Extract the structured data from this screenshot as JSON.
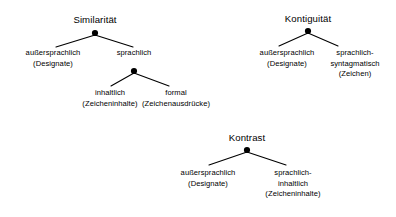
{
  "diagram": {
    "type": "tree-diagram",
    "background_color": "#ffffff",
    "text_color": "#000000",
    "line_color": "#000000",
    "trees": [
      {
        "id": "similaritaet",
        "root": {
          "label": "Similarität",
          "dot": true,
          "x": 95,
          "y": 33,
          "label_y": 14
        },
        "nodes": [
          {
            "id": "sim-aussersprachlich",
            "lines": [
              "außersprachlich",
              "(Designate)"
            ],
            "dot": false,
            "x": 53,
            "y": 48,
            "label_y": 48
          },
          {
            "id": "sim-sprachlich",
            "lines": [
              "sprachlich"
            ],
            "dot": true,
            "x": 134,
            "y": 71,
            "label_y": 48
          },
          {
            "id": "sim-inhaltlich",
            "lines": [
              "inhaltlich",
              "(Zeicheninhalte)"
            ],
            "dot": false,
            "x": 110,
            "y": 88,
            "label_y": 88
          },
          {
            "id": "sim-formal",
            "lines": [
              "formal",
              "(Zeichenausdrücke)"
            ],
            "dot": false,
            "x": 175,
            "y": 88,
            "label_y": 88
          }
        ],
        "edges": [
          {
            "from": "similaritaet-root",
            "x1": 95,
            "y1": 35,
            "x2": 56,
            "y2": 47
          },
          {
            "from": "similaritaet-root",
            "x1": 95,
            "y1": 35,
            "x2": 133,
            "y2": 47
          },
          {
            "from": "sim-sprachlich",
            "x1": 134,
            "y1": 73,
            "x2": 111,
            "y2": 86
          },
          {
            "from": "sim-sprachlich",
            "x1": 134,
            "y1": 73,
            "x2": 169,
            "y2": 86
          }
        ]
      },
      {
        "id": "kontiguitaet",
        "root": {
          "label": "Kontiguität",
          "dot": true,
          "x": 308,
          "y": 31,
          "label_y": 13
        },
        "nodes": [
          {
            "id": "kont-aussersprachlich",
            "lines": [
              "außersprachlich",
              "(Designate)"
            ],
            "dot": false,
            "x": 287,
            "y": 48,
            "label_y": 48
          },
          {
            "id": "kont-syntagmatisch",
            "lines": [
              "sprachlich-",
              "syntagmatisch",
              "(Zeichen)"
            ],
            "dot": false,
            "x": 353,
            "y": 48,
            "label_y": 48
          }
        ],
        "edges": [
          {
            "from": "kontiguitaet-root",
            "x1": 308,
            "y1": 33,
            "x2": 279,
            "y2": 46
          },
          {
            "from": "kontiguitaet-root",
            "x1": 308,
            "y1": 33,
            "x2": 338,
            "y2": 46
          }
        ]
      },
      {
        "id": "kontrast",
        "root": {
          "label": "Kontrast",
          "dot": true,
          "x": 247,
          "y": 150,
          "label_y": 132
        },
        "nodes": [
          {
            "id": "kontr-aussersprachlich",
            "lines": [
              "außersprachlich",
              "(Designate)"
            ],
            "dot": false,
            "x": 208,
            "y": 168,
            "label_y": 168
          },
          {
            "id": "kontr-inhaltlich",
            "lines": [
              "sprachlich-",
              "inhaltlich",
              "(Zeicheninhalte)"
            ],
            "dot": false,
            "x": 292,
            "y": 168,
            "label_y": 168
          },
          "edges-placeholder"
        ],
        "edges": [
          {
            "from": "kontrast-root",
            "x1": 247,
            "y1": 152,
            "x2": 209,
            "y2": 165
          },
          {
            "from": "kontrast-root",
            "x1": 247,
            "y1": 152,
            "x2": 286,
            "y2": 165
          }
        ]
      }
    ],
    "labels": {
      "similaritaet_root": "Similarität",
      "kontiguitaet_root": "Kontiguität",
      "kontrast_root": "Kontrast",
      "sim_child_1_l1": "außersprachlich",
      "sim_child_1_l2": "(Designate)",
      "sim_child_2_l1": "sprachlich",
      "sim_gchild_1_l1": "inhaltlich",
      "sim_gchild_1_l2": "(Zeicheninhalte)",
      "sim_gchild_2_l1": "formal",
      "sim_gchild_2_l2": "(Zeichenausdrücke)",
      "kont_child_1_l1": "außersprachlich",
      "kont_child_1_l2": "(Designate)",
      "kont_child_2_l1": "sprachlich-",
      "kont_child_2_l2": "syntagmatisch",
      "kont_child_2_l3": "(Zeichen)",
      "kontr_child_1_l1": "außersprachlich",
      "kontr_child_1_l2": "(Designate)",
      "kontr_child_2_l1": "sprachlich-",
      "kontr_child_2_l2": "inhaltlich",
      "kontr_child_2_l3": "(Zeicheninhalte)"
    }
  }
}
